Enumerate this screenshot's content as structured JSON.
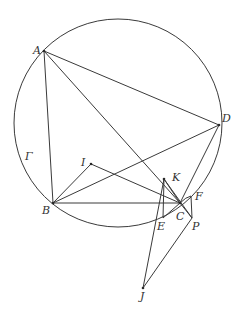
{
  "figure": {
    "width": 243,
    "height": 313,
    "stroke_color": "#3a3a3a",
    "circle": {
      "name": "Γ",
      "cx": 118,
      "cy": 123,
      "r": 104
    },
    "labels": {
      "A": "A",
      "B": "B",
      "C": "C",
      "D": "D",
      "E": "E",
      "F": "F",
      "I": "I",
      "J": "J",
      "K": "K",
      "P": "P",
      "Gamma": "Γ"
    },
    "points": {
      "A": [
        44,
        51
      ],
      "B": [
        53,
        203
      ],
      "C": [
        180,
        203
      ],
      "D": [
        219,
        125
      ],
      "E": [
        163,
        218
      ],
      "F": [
        191,
        196
      ],
      "I": [
        91,
        164
      ],
      "J": [
        143,
        288
      ],
      "K": [
        164,
        179
      ],
      "P": [
        192,
        218
      ]
    }
  }
}
